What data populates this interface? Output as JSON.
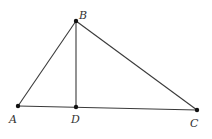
{
  "diagram": {
    "type": "geometry",
    "points": [
      {
        "id": "A",
        "label": "A",
        "x": 18,
        "y": 106,
        "lx": 9,
        "ly": 123
      },
      {
        "id": "B",
        "label": "B",
        "x": 76,
        "y": 21,
        "lx": 79,
        "ly": 19
      },
      {
        "id": "C",
        "label": "C",
        "x": 197,
        "y": 110,
        "lx": 190,
        "ly": 127
      },
      {
        "id": "D",
        "label": "D",
        "x": 76,
        "y": 107,
        "lx": 71,
        "ly": 123
      }
    ],
    "segments": [
      [
        "A",
        "B"
      ],
      [
        "B",
        "C"
      ],
      [
        "A",
        "C"
      ],
      [
        "B",
        "D"
      ]
    ]
  }
}
